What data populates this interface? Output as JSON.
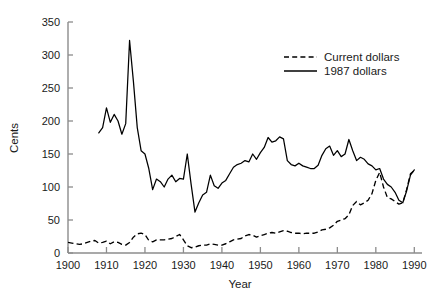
{
  "chart_data": {
    "type": "line",
    "title": "",
    "xlabel": "Year",
    "ylabel": "Cents",
    "xlim": [
      1900,
      1992
    ],
    "ylim": [
      0,
      350
    ],
    "xticks": [
      1900,
      1910,
      1920,
      1930,
      1940,
      1950,
      1960,
      1970,
      1980,
      1990
    ],
    "yticks": [
      0,
      50,
      100,
      150,
      200,
      250,
      300,
      350
    ],
    "xtick_labels": [
      "1900",
      "1910",
      "1920",
      "1930",
      "1940",
      "1950",
      "1960",
      "1970",
      "1980",
      "1990"
    ],
    "ytick_labels": [
      "0",
      "50",
      "100",
      "150",
      "200",
      "250",
      "300",
      "350"
    ],
    "grid": false,
    "legend_position": "upper-right",
    "legend": [
      "Current dollars",
      "1987 dollars"
    ],
    "series": [
      {
        "name": "Current dollars",
        "style": "dashed",
        "color": "#000000",
        "x": [
          1900,
          1901,
          1902,
          1903,
          1904,
          1905,
          1906,
          1907,
          1908,
          1909,
          1910,
          1911,
          1912,
          1913,
          1914,
          1915,
          1916,
          1917,
          1918,
          1919,
          1920,
          1921,
          1922,
          1923,
          1924,
          1925,
          1926,
          1927,
          1928,
          1929,
          1930,
          1931,
          1932,
          1933,
          1934,
          1935,
          1936,
          1937,
          1938,
          1939,
          1940,
          1941,
          1942,
          1943,
          1944,
          1945,
          1946,
          1947,
          1948,
          1949,
          1950,
          1951,
          1952,
          1953,
          1954,
          1955,
          1956,
          1957,
          1958,
          1959,
          1960,
          1961,
          1962,
          1963,
          1964,
          1965,
          1966,
          1967,
          1968,
          1969,
          1970,
          1971,
          1972,
          1973,
          1974,
          1975,
          1976,
          1977,
          1978,
          1979,
          1980,
          1981,
          1982,
          1983,
          1984,
          1985,
          1986,
          1987,
          1988,
          1989,
          1990
        ],
        "values": [
          16,
          15,
          14,
          13,
          14,
          16,
          18,
          19,
          15,
          16,
          18,
          14,
          17,
          16,
          13,
          12,
          16,
          24,
          29,
          30,
          28,
          19,
          17,
          20,
          20,
          20,
          21,
          22,
          25,
          28,
          20,
          11,
          8,
          9,
          11,
          12,
          12,
          14,
          13,
          12,
          12,
          14,
          17,
          20,
          21,
          22,
          26,
          28,
          27,
          24,
          26,
          28,
          30,
          31,
          30,
          32,
          34,
          33,
          31,
          30,
          30,
          29,
          30,
          30,
          30,
          32,
          35,
          36,
          38,
          42,
          48,
          50,
          52,
          58,
          72,
          78,
          73,
          76,
          80,
          90,
          110,
          122,
          100,
          84,
          82,
          78,
          74,
          76,
          96,
          120,
          125
        ]
      },
      {
        "name": "1987 dollars",
        "style": "solid",
        "color": "#000000",
        "x": [
          1908,
          1909,
          1910,
          1911,
          1912,
          1913,
          1914,
          1915,
          1916,
          1917,
          1918,
          1919,
          1920,
          1921,
          1922,
          1923,
          1924,
          1925,
          1926,
          1927,
          1928,
          1929,
          1930,
          1931,
          1932,
          1933,
          1934,
          1935,
          1936,
          1937,
          1938,
          1939,
          1940,
          1941,
          1942,
          1943,
          1944,
          1945,
          1946,
          1947,
          1948,
          1949,
          1950,
          1951,
          1952,
          1953,
          1954,
          1955,
          1956,
          1957,
          1958,
          1959,
          1960,
          1961,
          1962,
          1963,
          1964,
          1965,
          1966,
          1967,
          1968,
          1969,
          1970,
          1971,
          1972,
          1973,
          1974,
          1975,
          1976,
          1977,
          1978,
          1979,
          1980,
          1981,
          1982,
          1983,
          1984,
          1985,
          1986,
          1987,
          1988,
          1989,
          1990
        ],
        "values": [
          182,
          190,
          220,
          198,
          210,
          200,
          180,
          196,
          322,
          260,
          190,
          155,
          150,
          128,
          96,
          112,
          108,
          100,
          112,
          118,
          108,
          113,
          112,
          150,
          104,
          62,
          76,
          88,
          92,
          118,
          102,
          98,
          106,
          110,
          120,
          130,
          134,
          136,
          140,
          138,
          150,
          142,
          152,
          160,
          175,
          168,
          170,
          176,
          173,
          140,
          134,
          132,
          136,
          132,
          130,
          128,
          128,
          133,
          148,
          158,
          162,
          148,
          155,
          146,
          150,
          172,
          155,
          140,
          145,
          142,
          135,
          132,
          126,
          128,
          112,
          104,
          100,
          92,
          80,
          76,
          94,
          118,
          126
        ]
      }
    ]
  },
  "axes": {
    "ylabel": "Cents",
    "xlabel": "Year"
  },
  "legend": {
    "entries": [
      {
        "label": "Current dollars",
        "style": "dashed"
      },
      {
        "label": "1987 dollars",
        "style": "solid"
      }
    ]
  },
  "colors": {
    "line": "#000000",
    "axis": "#8c8c8c",
    "text": "#1a1a1a",
    "background": "#ffffff"
  }
}
